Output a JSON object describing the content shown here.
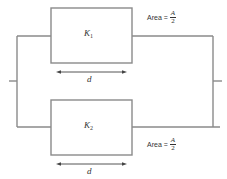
{
  "diagram": {
    "type": "parallel-plate-capacitor-circuit",
    "colors": {
      "wire": "#8a8a8a",
      "text": "#333333",
      "background": "#ffffff"
    },
    "capacitors": [
      {
        "dielectric_symbol": "K",
        "dielectric_subscript": "1",
        "separation_label": "d",
        "area_prefix": "Area =",
        "area_numerator": "A",
        "area_denominator": "2"
      },
      {
        "dielectric_symbol": "K",
        "dielectric_subscript": "2",
        "separation_label": "d",
        "area_prefix": "Area =",
        "area_numerator": "A",
        "area_denominator": "2"
      }
    ],
    "connection": "parallel"
  }
}
